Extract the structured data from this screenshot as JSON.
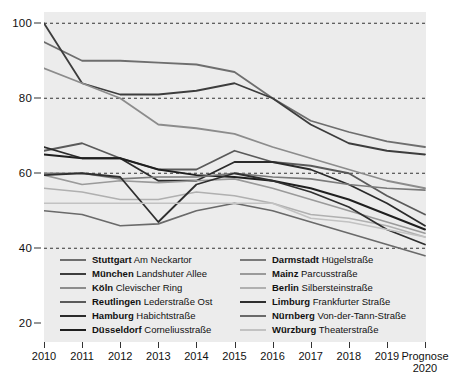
{
  "chart_data": {
    "type": "line",
    "title": "",
    "subtitle": "",
    "xlabel": "",
    "ylabel": "",
    "grid": true,
    "gridlines": [
      40,
      60,
      80,
      100
    ],
    "legend_position": "inside-bottom",
    "ylim": [
      15,
      103
    ],
    "yticks": [
      20,
      40,
      60,
      80,
      100
    ],
    "ytick_labels": [
      "20",
      "40",
      "60",
      "80",
      "100"
    ],
    "x": [
      "2010",
      "2011",
      "2012",
      "2013",
      "2014",
      "2015",
      "2016",
      "2017",
      "2018",
      "2019",
      "Prognose 2020"
    ],
    "categories": [
      "2010",
      "2011",
      "2012",
      "2013",
      "2014",
      "2015",
      "2016",
      "2017",
      "2018",
      "2019",
      "Prognose 2020"
    ],
    "series": [
      {
        "name": "Stuttgart Am Neckartor",
        "city": "Stuttgart",
        "street": "Am Neckartor",
        "color": "#6e6e6e",
        "width": 1.8,
        "values": [
          95,
          90,
          90,
          89.5,
          89,
          87,
          80,
          74,
          71,
          68.5,
          67
        ]
      },
      {
        "name": "München Landshuter Allee",
        "city": "München",
        "street": "Landshuter Allee",
        "color": "#3d3d3d",
        "width": 1.8,
        "values": [
          100,
          84,
          81,
          81,
          82,
          84,
          80,
          73,
          68,
          66,
          65
        ]
      },
      {
        "name": "Köln Clevischer Ring",
        "city": "Köln",
        "street": "Clevischer Ring",
        "color": "#8c8c8c",
        "width": 1.8,
        "values": [
          88,
          84,
          80,
          73,
          72,
          70.5,
          67,
          64,
          61,
          58,
          56
        ]
      },
      {
        "name": "Reutlingen Lederstraße Ost",
        "city": "Reutlingen",
        "street": "Lederstraße Ost",
        "color": "#5a5a5a",
        "width": 1.8,
        "values": [
          66,
          68,
          64,
          61,
          61,
          66,
          63,
          62,
          60,
          54,
          49
        ]
      },
      {
        "name": "Hamburg Habichtstraße",
        "city": "Hamburg",
        "street": "Habichtstraße",
        "color": "#2b2b2b",
        "width": 1.8,
        "values": [
          67,
          64,
          64,
          58,
          58,
          63,
          63,
          61,
          57,
          52,
          46
        ]
      },
      {
        "name": "Düsseldorf Corneliusstraße",
        "city": "Düsseldorf",
        "street": "Corneliusstraße",
        "color": "#1f1f1f",
        "width": 1.9,
        "values": [
          65,
          64,
          64,
          61,
          59.5,
          59,
          58,
          56,
          53,
          49,
          45
        ]
      },
      {
        "name": "Darmstadt Hügelstraße",
        "city": "Darmstadt",
        "street": "Hügelstraße",
        "color": "#7a7a7a",
        "width": 1.6,
        "values": [
          60,
          60,
          58.5,
          59,
          59,
          60,
          59,
          58.5,
          57,
          56,
          55.5
        ]
      },
      {
        "name": "Mainz Parcusstraße",
        "city": "Mainz",
        "street": "Parcusstraße",
        "color": "#9a9a9a",
        "width": 1.6,
        "values": [
          59.5,
          57,
          58,
          57.5,
          58,
          58.5,
          56,
          53,
          50,
          47,
          44
        ]
      },
      {
        "name": "Berlin Silbersteinstraße",
        "city": "Berlin",
        "street": "Silbersteinstraße",
        "color": "#b0b0b0",
        "width": 1.6,
        "values": [
          56,
          55,
          53,
          53,
          55,
          54,
          52,
          49,
          48,
          46,
          43
        ]
      },
      {
        "name": "Limburg Frankfurter Straße",
        "city": "Limburg",
        "street": "Frankfurter Straße",
        "color": "#2f2f2f",
        "width": 1.8,
        "values": [
          59.5,
          60,
          59,
          47,
          57,
          60,
          58,
          55,
          51,
          45,
          41
        ]
      },
      {
        "name": "Nürnberg Von-der-Tann-Straße",
        "city": "Nürnberg",
        "street": "Von-der-Tann-Straße",
        "color": "#6a6a6a",
        "width": 1.7,
        "values": [
          50,
          49,
          46,
          46.5,
          50,
          52,
          50,
          47,
          44,
          41,
          38
        ]
      },
      {
        "name": "Würzburg Theaterstraße",
        "city": "Würzburg",
        "street": "Theaterstraße",
        "color": "#c2c2c2",
        "width": 1.7,
        "values": [
          52,
          52,
          52,
          52,
          52,
          52,
          52,
          48,
          47,
          45,
          43
        ]
      }
    ]
  },
  "axes": {
    "y_ticks": [
      {
        "label": "100",
        "value": 100
      },
      {
        "label": "80",
        "value": 80
      },
      {
        "label": "60",
        "value": 60
      },
      {
        "label": "40",
        "value": 40
      },
      {
        "label": "20",
        "value": 20
      }
    ],
    "x_ticks": [
      {
        "line1": "2010",
        "line2": ""
      },
      {
        "line1": "2011",
        "line2": ""
      },
      {
        "line1": "2012",
        "line2": ""
      },
      {
        "line1": "2013",
        "line2": ""
      },
      {
        "line1": "2014",
        "line2": ""
      },
      {
        "line1": "2015",
        "line2": ""
      },
      {
        "line1": "2016",
        "line2": ""
      },
      {
        "line1": "2017",
        "line2": ""
      },
      {
        "line1": "2018",
        "line2": ""
      },
      {
        "line1": "2019",
        "line2": ""
      },
      {
        "line1": "Prognose",
        "line2": "2020"
      }
    ]
  },
  "legend": {
    "columns": [
      {
        "items": [
          {
            "city": "Stuttgart",
            "street": " Am Neckartor",
            "color": "#6e6e6e"
          },
          {
            "city": "München",
            "street": " Landshuter Allee",
            "color": "#3d3d3d"
          },
          {
            "city": "Köln",
            "street": " Clevischer Ring",
            "color": "#8c8c8c"
          },
          {
            "city": "Reutlingen",
            "street": " Lederstraße Ost",
            "color": "#5a5a5a"
          },
          {
            "city": "Hamburg",
            "street": " Habichtstraße",
            "color": "#2b2b2b"
          },
          {
            "city": "Düsseldorf",
            "street": " Corneliusstraße",
            "color": "#1f1f1f"
          }
        ]
      },
      {
        "items": [
          {
            "city": "Darmstadt",
            "street": " Hügelstraße",
            "color": "#7a7a7a"
          },
          {
            "city": "Mainz",
            "street": " Parcusstraße",
            "color": "#9a9a9a"
          },
          {
            "city": "Berlin",
            "street": " Silbersteinstraße",
            "color": "#b0b0b0"
          },
          {
            "city": "Limburg",
            "street": " Frankfurter Straße",
            "color": "#2f2f2f"
          },
          {
            "city": "Nürnberg",
            "street": " Von-der-Tann-Straße",
            "color": "#6a6a6a"
          },
          {
            "city": "Würzburg",
            "street": " Theaterstraße",
            "color": "#c2c2c2"
          }
        ]
      }
    ]
  },
  "colors": {
    "plot_background": "#ececec",
    "page_background": "#ffffff",
    "gridline": "#333333",
    "axis_text": "#111111"
  }
}
